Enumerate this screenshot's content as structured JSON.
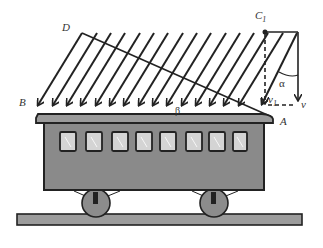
{
  "diagram": {
    "labels": {
      "D": "D",
      "B": "B",
      "C1_main": "C",
      "C1_sub": "1",
      "A": "A",
      "alpha": "α",
      "beta": "β",
      "v1_main": "v",
      "v1_sub": "1",
      "v": "v"
    },
    "rain": {
      "line_count": 16,
      "color": "#222222"
    },
    "train": {
      "body_color": "#8a8a8a",
      "roof_color": "#9a9a9a",
      "window_count": 8,
      "window_color": "#d4d4d4",
      "wheel_count": 2,
      "rail_color": "#9c9c9c"
    }
  }
}
